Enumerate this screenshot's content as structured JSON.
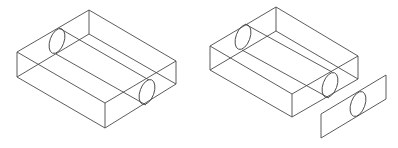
{
  "diagram": {
    "title": "",
    "background": "#ffffff",
    "stroke_color": "#4a4a4a",
    "figures": [
      {
        "name": "box-with-bore",
        "description": "Rectangular block with a cylindrical bore running through it (wireframe isometric)",
        "vertices": {
          "top_back": [
            89,
            10
          ],
          "top_left": [
            17,
            52
          ],
          "top_right": [
            176,
            61
          ],
          "top_front": [
            105,
            103
          ],
          "bottom_left": [
            17,
            77
          ],
          "bottom_right": [
            176,
            84
          ],
          "bottom_front": [
            105,
            128
          ],
          "bottom_back": [
            89,
            34
          ]
        },
        "holes": [
          {
            "cx": 57,
            "cy": 41,
            "rx": 7,
            "ry": 13,
            "rot": 20
          },
          {
            "cx": 147,
            "cy": 92,
            "rx": 7,
            "ry": 13,
            "rot": 20
          }
        ]
      },
      {
        "name": "box-with-bore-and-separated-plate",
        "description": "Same block with end face plate shown detached (exploded view)",
        "vertices": {
          "top_back": [
            276,
            7
          ],
          "top_left": [
            210,
            46
          ],
          "top_right": [
            358,
            56
          ],
          "top_front": [
            292,
            94
          ],
          "bottom_left": [
            210,
            70
          ],
          "bottom_right": [
            358,
            79
          ],
          "bottom_front": [
            292,
            117
          ],
          "bottom_back": [
            276,
            31
          ]
        },
        "holes": [
          {
            "cx": 243,
            "cy": 37,
            "rx": 7,
            "ry": 13,
            "rot": 20
          },
          {
            "cx": 330,
            "cy": 85,
            "rx": 7,
            "ry": 13,
            "rot": 20
          }
        ],
        "plate": {
          "corners": [
            [
              321,
              114
            ],
            [
              386,
              75
            ],
            [
              386,
              99
            ],
            [
              321,
              138
            ]
          ],
          "hole": {
            "cx": 358,
            "cy": 104,
            "rx": 7,
            "ry": 13,
            "rot": 20
          }
        }
      }
    ]
  }
}
